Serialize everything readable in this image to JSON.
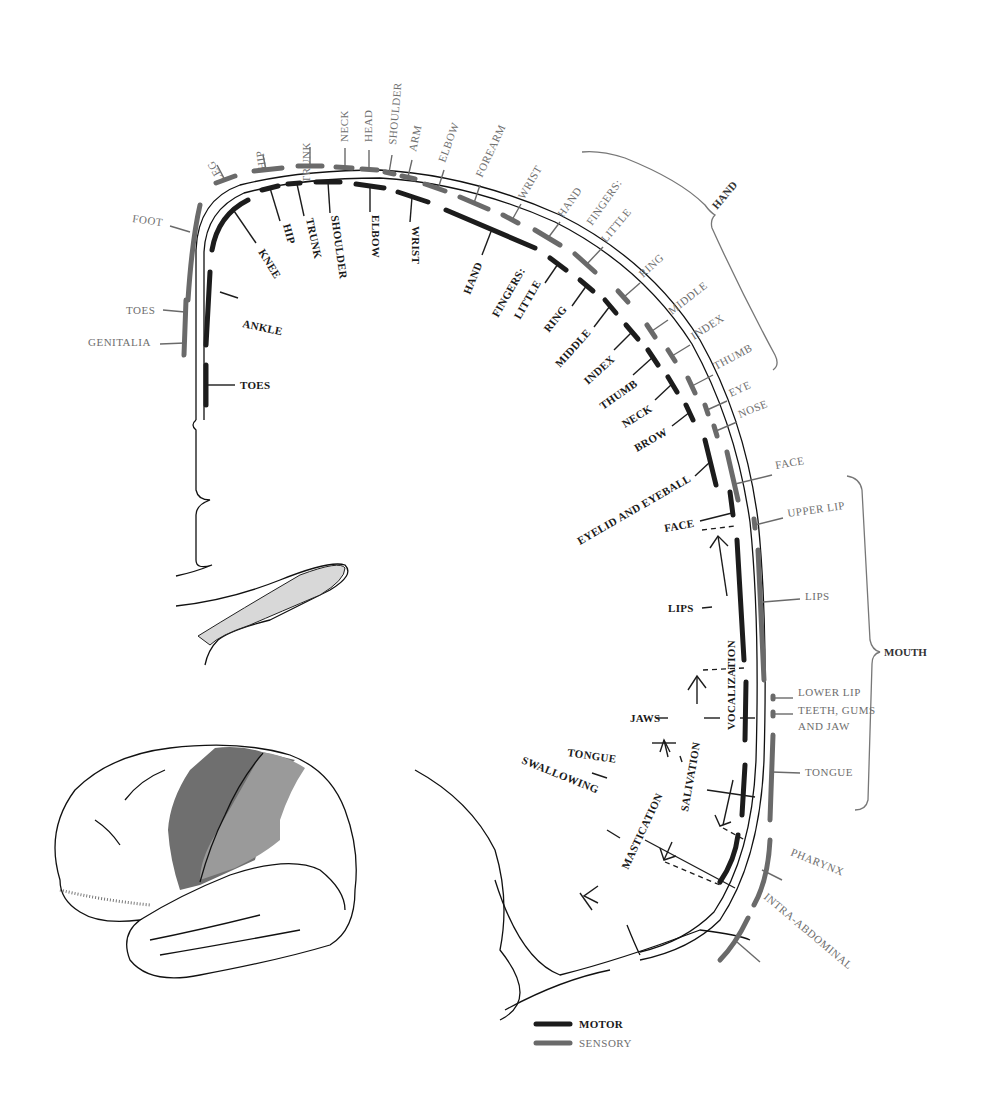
{
  "diagram": {
    "type": "motor-sensory-homunculus-cortex-section",
    "colors": {
      "motor": "#1c1c1c",
      "sensory": "#6a6a6a",
      "motor_area_fill": "#6f6f6f",
      "sensory_area_fill": "#9a9a9a"
    },
    "motor_labels": {
      "knee": "KNEE",
      "hip": "HIP",
      "trunk": "TRUNK",
      "shoulder": "SHOULDER",
      "elbow": "ELBOW",
      "wrist": "WRIST",
      "hand": "HAND",
      "fingers": "FINGERS:",
      "little": "LITTLE",
      "ring": "RING",
      "middle": "MIDDLE",
      "index": "INDEX",
      "thumb": "THUMB",
      "neck": "NECK",
      "brow": "BROW",
      "eyelid": "EYELID AND EYEBALL",
      "face": "FACE",
      "lips": "LIPS",
      "jaws": "JAWS",
      "tongue": "TONGUE",
      "swallowing": "SWALLOWING",
      "ankle": "ANKLE",
      "toes": "TOES",
      "vocalization": "VOCALIZATION",
      "salivation": "SALIVATION",
      "mastication": "MASTICATION"
    },
    "sensory_labels": {
      "foot": "FOOT",
      "toes": "TOES",
      "genitalia": "GENITALIA",
      "leg": "LEG",
      "hip": "HIP",
      "trunk": "TRUNK",
      "neck": "NECK",
      "head": "HEAD",
      "shoulder": "SHOULDER",
      "arm": "ARM",
      "elbow": "ELBOW",
      "forearm": "FOREARM",
      "wrist": "WRIST",
      "hand": "HAND",
      "fingers": "FINGERS:",
      "little": "LITTLE",
      "ring": "RING",
      "middle": "MIDDLE",
      "index": "INDEX",
      "thumb": "THUMB",
      "eye": "EYE",
      "nose": "NOSE",
      "face": "FACE",
      "upper_lip": "UPPER LIP",
      "lips": "LIPS",
      "lower_lip": "LOWER LIP",
      "teeth_1": "TEETH, GUMS",
      "teeth_2": "AND JAW",
      "tongue": "TONGUE",
      "pharynx": "PHARYNX",
      "intra_abdominal": "INTRA-ABDOMINAL"
    },
    "groups": {
      "hand": "HAND",
      "mouth": "MOUTH"
    },
    "legend": {
      "motor": "MOTOR",
      "sensory": "SENSORY"
    }
  }
}
